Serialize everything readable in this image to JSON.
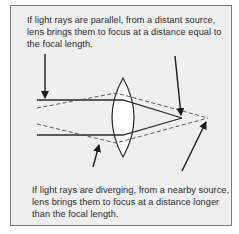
{
  "figure": {
    "caption_top": "If light rays are parallel, from a distant source, lens brings them to focus at a distance equal to the focal length.",
    "caption_bottom": "If light rays are diverging, from a nearby source, lens brings them to focus at a distance longer than the focal length.",
    "colors": {
      "panel_background": "#efefef",
      "panel_border": "#7a7a7a",
      "ray_color": "#2a2a2a",
      "lens_fill": "#ffffff",
      "text_color": "#2a2a2a"
    },
    "elements": {
      "lens": "biconvex-lens",
      "parallel_rays": "solid-lines",
      "diverging_rays": "dashed-lines",
      "focal_point_near": "focal-length-point",
      "focal_point_far": "longer-focus-point"
    }
  }
}
